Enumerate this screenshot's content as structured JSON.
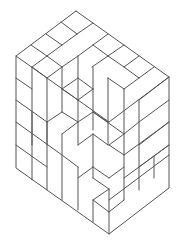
{
  "figure": {
    "stroke_color": "#555555",
    "background": "#ffffff",
    "outline": [
      [
        76,
        11
      ],
      [
        169,
        77
      ],
      [
        169,
        188
      ],
      [
        109,
        234
      ],
      [
        16,
        168
      ],
      [
        16,
        56
      ],
      [
        76,
        11
      ]
    ],
    "segments": [
      [
        [
          16,
          56
        ],
        [
          109,
          122
        ]
      ],
      [
        [
          109,
          122
        ],
        [
          169,
          77
        ]
      ],
      [
        [
          46,
          34
        ],
        [
          62,
          45
        ]
      ],
      [
        [
          62,
          45
        ],
        [
          77,
          34
        ]
      ],
      [
        [
          61,
          22
        ],
        [
          77,
          34
        ]
      ],
      [
        [
          77,
          34
        ],
        [
          93,
          23
        ]
      ],
      [
        [
          31,
          45
        ],
        [
          47,
          56
        ]
      ],
      [
        [
          47,
          56
        ],
        [
          62,
          45
        ]
      ],
      [
        [
          47,
          56
        ],
        [
          62,
          67
        ]
      ],
      [
        [
          62,
          67
        ],
        [
          78,
          56
        ]
      ],
      [
        [
          78,
          56
        ],
        [
          93,
          45
        ]
      ],
      [
        [
          93,
          45
        ],
        [
          108,
          34
        ]
      ],
      [
        [
          93,
          45
        ],
        [
          108,
          56
        ]
      ],
      [
        [
          108,
          56
        ],
        [
          124,
          45
        ]
      ],
      [
        [
          92,
          67
        ],
        [
          108,
          56
        ]
      ],
      [
        [
          108,
          56
        ],
        [
          124,
          67
        ]
      ],
      [
        [
          124,
          67
        ],
        [
          139,
          56
        ]
      ],
      [
        [
          124,
          67
        ],
        [
          139,
          78
        ]
      ],
      [
        [
          139,
          78
        ],
        [
          154,
          67
        ]
      ],
      [
        [
          32,
          67
        ],
        [
          32,
          180
        ]
      ],
      [
        [
          32,
          67
        ],
        [
          47,
          56
        ]
      ],
      [
        [
          47,
          78
        ],
        [
          62,
          67
        ]
      ],
      [
        [
          47,
          78
        ],
        [
          47,
          190
        ]
      ],
      [
        [
          32,
          67
        ],
        [
          47,
          78
        ]
      ],
      [
        [
          62,
          67
        ],
        [
          62,
          112
        ]
      ],
      [
        [
          78,
          56
        ],
        [
          78,
          100
        ]
      ],
      [
        [
          62,
          89
        ],
        [
          78,
          78
        ]
      ],
      [
        [
          62,
          89
        ],
        [
          78,
          100
        ]
      ],
      [
        [
          78,
          100
        ],
        [
          93,
          89
        ]
      ],
      [
        [
          93,
          89
        ],
        [
          93,
          130
        ]
      ],
      [
        [
          78,
          78
        ],
        [
          93,
          89
        ]
      ],
      [
        [
          78,
          100
        ],
        [
          78,
          145
        ]
      ],
      [
        [
          93,
          67
        ],
        [
          93,
          89
        ]
      ],
      [
        [
          108,
          78
        ],
        [
          108,
          145
        ]
      ],
      [
        [
          108,
          78
        ],
        [
          124,
          89
        ]
      ],
      [
        [
          124,
          89
        ],
        [
          139,
          78
        ]
      ],
      [
        [
          124,
          89
        ],
        [
          124,
          200
        ]
      ],
      [
        [
          139,
          100
        ],
        [
          169,
          77
        ]
      ],
      [
        [
          139,
          100
        ],
        [
          139,
          190
        ]
      ],
      [
        [
          139,
          122
        ],
        [
          169,
          100
        ]
      ],
      [
        [
          139,
          145
        ],
        [
          169,
          122
        ]
      ],
      [
        [
          124,
          155
        ],
        [
          169,
          122
        ]
      ],
      [
        [
          124,
          178
        ],
        [
          169,
          145
        ]
      ],
      [
        [
          139,
          167
        ],
        [
          169,
          145
        ]
      ],
      [
        [
          154,
          156
        ],
        [
          154,
          178
        ]
      ],
      [
        [
          109,
          200
        ],
        [
          169,
          155
        ]
      ],
      [
        [
          16,
          78
        ],
        [
          32,
          89
        ]
      ],
      [
        [
          16,
          100
        ],
        [
          47,
          122
        ]
      ],
      [
        [
          16,
          122
        ],
        [
          62,
          155
        ]
      ],
      [
        [
          16,
          145
        ],
        [
          47,
          167
        ]
      ],
      [
        [
          47,
          122
        ],
        [
          62,
          112
        ]
      ],
      [
        [
          47,
          122
        ],
        [
          47,
          145
        ]
      ],
      [
        [
          32,
          112
        ],
        [
          32,
          145
        ]
      ],
      [
        [
          62,
          112
        ],
        [
          78,
          122
        ]
      ],
      [
        [
          62,
          134
        ],
        [
          78,
          122
        ]
      ],
      [
        [
          62,
          134
        ],
        [
          62,
          200
        ]
      ],
      [
        [
          62,
          155
        ],
        [
          78,
          167
        ]
      ],
      [
        [
          78,
          122
        ],
        [
          93,
          112
        ]
      ],
      [
        [
          93,
          112
        ],
        [
          108,
          122
        ]
      ],
      [
        [
          78,
          145
        ],
        [
          93,
          134
        ]
      ],
      [
        [
          93,
          134
        ],
        [
          108,
          145
        ]
      ],
      [
        [
          93,
          134
        ],
        [
          93,
          178
        ]
      ],
      [
        [
          78,
          167
        ],
        [
          78,
          210
        ]
      ],
      [
        [
          78,
          178
        ],
        [
          93,
          167
        ]
      ],
      [
        [
          93,
          167
        ],
        [
          109,
          178
        ]
      ],
      [
        [
          93,
          178
        ],
        [
          109,
          189
        ]
      ],
      [
        [
          109,
          145
        ],
        [
          124,
          134
        ]
      ],
      [
        [
          109,
          145
        ],
        [
          124,
          155
        ]
      ],
      [
        [
          93,
          112
        ],
        [
          124,
          134
        ]
      ],
      [
        [
          124,
          134
        ],
        [
          139,
          122
        ]
      ],
      [
        [
          109,
          178
        ],
        [
          124,
          167
        ]
      ],
      [
        [
          109,
          189
        ],
        [
          109,
          234
        ]
      ],
      [
        [
          93,
          200
        ],
        [
          109,
          189
        ]
      ],
      [
        [
          93,
          200
        ],
        [
          109,
          212
        ]
      ],
      [
        [
          109,
          212
        ],
        [
          124,
          200
        ]
      ],
      [
        [
          93,
          200
        ],
        [
          93,
          222
        ]
      ]
    ]
  }
}
